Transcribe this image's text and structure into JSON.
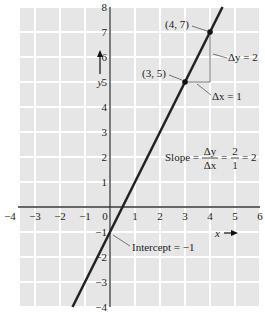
{
  "chart_data": {
    "type": "line",
    "title": "",
    "xlabel": "x",
    "ylabel": "y",
    "xlim": [
      -4,
      6
    ],
    "ylim": [
      -4,
      8
    ],
    "grid": true,
    "x_ticks": [
      "-4",
      "-3",
      "-2",
      "-1",
      "0",
      "1",
      "2",
      "3",
      "4",
      "5",
      "6"
    ],
    "y_ticks": [
      "-4",
      "-3",
      "-2",
      "-1",
      "1",
      "2",
      "3",
      "4",
      "5",
      "6",
      "7",
      "8"
    ],
    "series": [
      {
        "name": "y = 2x - 1",
        "x": [
          -1.5,
          4.5
        ],
        "y": [
          -4,
          8
        ]
      }
    ],
    "points": [
      {
        "label": "(3, 5)",
        "x": 3,
        "y": 5
      },
      {
        "label": "(4, 7)",
        "x": 4,
        "y": 7
      }
    ],
    "annotations": {
      "delta_y": "Δy = 2",
      "delta_x": "Δx = 1",
      "slope": {
        "prefix": "Slope =",
        "num1": "Δy",
        "den1": "Δx",
        "num2": "2",
        "den2": "1",
        "result": "= 2"
      },
      "intercept": "Intercept = −1"
    }
  },
  "colors": {
    "background": "#e6e6e6",
    "grid": "#ffffff",
    "line": "#222222"
  }
}
